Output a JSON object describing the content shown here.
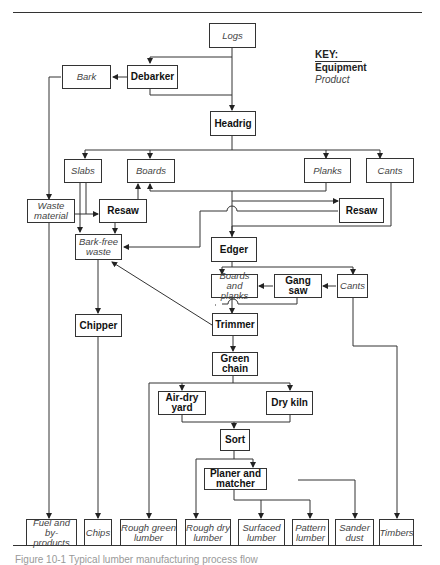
{
  "key": {
    "title": "KEY:",
    "equipment": "Equipment",
    "product": "Product"
  },
  "nodes": {
    "logs": "Logs",
    "bark": "Bark",
    "debarker": "Debarker",
    "headrig": "Headrig",
    "slabs": "Slabs",
    "boards": "Boards",
    "planks": "Planks",
    "cants_top": "Cants",
    "waste_material": "Waste material",
    "resaw_left": "Resaw",
    "resaw_right": "Resaw",
    "bark_free_waste": "Bark-free waste",
    "edger": "Edger",
    "boards_and_planks": "Boards and planks",
    "gang_saw": "Gang saw",
    "cants_mid": "Cants",
    "chipper": "Chipper",
    "trimmer": "Trimmer",
    "green_chain": "Green chain",
    "air_dry_yard": "Air-dry yard",
    "dry_kiln": "Dry kiln",
    "sort": "Sort",
    "planer_and_matcher": "Planer and matcher",
    "fuel_and_byproducts": "Fuel and by-products",
    "chips": "Chips",
    "rough_green_lumber": "Rough green lumber",
    "rough_dry_lumber": "Rough dry lumber",
    "surfaced_lumber": "Surfaced lumber",
    "pattern_lumber": "Pattern lumber",
    "sander_dust": "Sander dust",
    "timbers": "Timbers"
  },
  "caption": "Figure 10-1 Typical lumber manufacturing process flow"
}
